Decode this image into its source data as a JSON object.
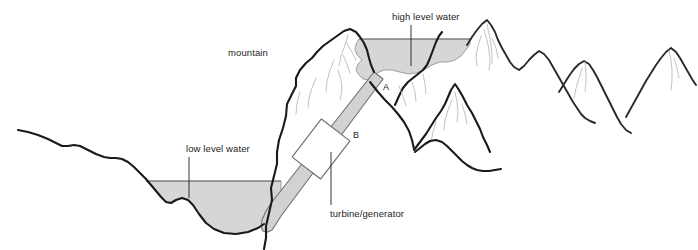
{
  "diagram": {
    "labels": {
      "mountain": "mountain",
      "high_level_water": "high level water",
      "low_level_water": "low level water",
      "turbine_generator": "turbine/generator",
      "point_a": "A",
      "point_b": "B"
    },
    "colors": {
      "water_fill": "#d6d6d6",
      "water_edge": "#8d8d8d",
      "terrain_outline": "#1a1a1a",
      "crease": "#b7b7b7",
      "penstock_fill": "#d2d2d2",
      "penstock_edge": "#6f6f6f",
      "turbine_fill": "#ffffff",
      "text": "#1d1d1d",
      "background": "#ffffff"
    },
    "icon_names": {
      "mountain": "mountain-icon",
      "reservoir": "water-body-icon",
      "pipe": "penstock-pipe-icon",
      "turbine": "turbine-generator-icon"
    }
  }
}
